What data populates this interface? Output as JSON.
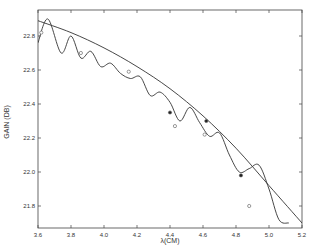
{
  "chart_data": {
    "type": "line",
    "title": "",
    "xlabel": "λ(CM)",
    "ylabel": "GAIN (DB)",
    "xlim": [
      3.6,
      5.2
    ],
    "ylim": [
      21.7,
      22.95
    ],
    "x_ticks": [
      "3.6",
      "3.8",
      "4.0",
      "4.2",
      "4.4",
      "4.6",
      "4.8",
      "5.0",
      "5.2"
    ],
    "y_ticks": [
      "21.8",
      "22.0",
      "22.2",
      "22.4",
      "22.6",
      "22.8"
    ],
    "grid": false,
    "series": [
      {
        "name": "smooth fit",
        "style": "line",
        "x": [
          3.6,
          3.8,
          4.0,
          4.2,
          4.4,
          4.6,
          4.8,
          5.0,
          5.2
        ],
        "y": [
          22.89,
          22.82,
          22.73,
          22.62,
          22.49,
          22.33,
          22.14,
          21.92,
          21.7
        ]
      },
      {
        "name": "oscillating theory",
        "style": "line",
        "x": [
          3.6,
          3.66,
          3.74,
          3.8,
          3.86,
          3.92,
          3.98,
          4.04,
          4.1,
          4.16,
          4.22,
          4.28,
          4.34,
          4.4,
          4.46,
          4.52,
          4.58,
          4.64,
          4.7,
          4.76,
          4.82,
          4.88,
          4.94,
          5.0,
          5.06,
          5.12
        ],
        "y": [
          22.76,
          22.9,
          22.7,
          22.8,
          22.67,
          22.71,
          22.62,
          22.64,
          22.58,
          22.55,
          22.56,
          22.45,
          22.47,
          22.41,
          22.3,
          22.38,
          22.29,
          22.21,
          22.23,
          22.1,
          22.0,
          22.02,
          22.04,
          21.9,
          21.72,
          21.7
        ]
      },
      {
        "name": "measured (open)",
        "style": "marker-open",
        "x": [
          3.62,
          3.86,
          4.15,
          4.43,
          4.61,
          4.88
        ],
        "y": [
          22.82,
          22.7,
          22.59,
          22.27,
          22.22,
          21.8
        ]
      },
      {
        "name": "measured (filled)",
        "style": "marker-filled",
        "x": [
          4.4,
          4.62,
          4.83
        ],
        "y": [
          22.35,
          22.3,
          21.98
        ]
      }
    ]
  },
  "labels": {
    "xlabel": "λ(CM)",
    "ylabel": "GAIN (DB)"
  }
}
